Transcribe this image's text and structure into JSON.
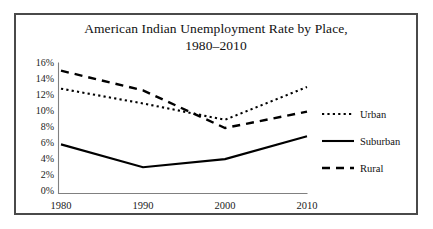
{
  "figure": {
    "border_color": "#4a4a4a",
    "background": "#ffffff"
  },
  "title": {
    "line1": "American Indian Unemployment Rate by Place,",
    "line2": "1980–2010"
  },
  "axis": {
    "y_ticks": [
      "16%",
      "14%",
      "12%",
      "10%",
      "8%",
      "6%",
      "4%",
      "2%",
      "0%"
    ],
    "x_ticks": [
      "1980",
      "1990",
      "2000",
      "2010"
    ]
  },
  "legend": {
    "position": "right",
    "entries": [
      {
        "label": "Urban",
        "style": "dotted"
      },
      {
        "label": "Suburban",
        "style": "solid"
      },
      {
        "label": "Rural",
        "style": "dashed"
      }
    ]
  },
  "chart_data": {
    "type": "line",
    "title": "American Indian Unemployment Rate by Place, 1980–2010",
    "xlabel": "",
    "ylabel": "",
    "x": [
      1980,
      1990,
      2000,
      2010
    ],
    "categories": [
      "1980",
      "1990",
      "2000",
      "2010"
    ],
    "ylim": [
      0,
      16
    ],
    "ytick_values": [
      16,
      14,
      12,
      10,
      8,
      6,
      4,
      2,
      0
    ],
    "ytick_labels": [
      "16%",
      "14%",
      "12%",
      "10%",
      "8%",
      "6%",
      "4%",
      "2%",
      "0%"
    ],
    "xtick_labels": [
      "1980",
      "1990",
      "2000",
      "2010"
    ],
    "grid": false,
    "legend_position": "right",
    "series": [
      {
        "name": "Urban",
        "style": "dotted",
        "color": "#000000",
        "values": [
          12.8,
          11.0,
          9.0,
          13.0
        ]
      },
      {
        "name": "Suburban",
        "style": "solid",
        "color": "#000000",
        "values": [
          6.0,
          3.2,
          4.2,
          7.0
        ]
      },
      {
        "name": "Rural",
        "style": "dashed",
        "color": "#000000",
        "values": [
          15.0,
          12.6,
          8.0,
          10.0
        ]
      }
    ]
  }
}
